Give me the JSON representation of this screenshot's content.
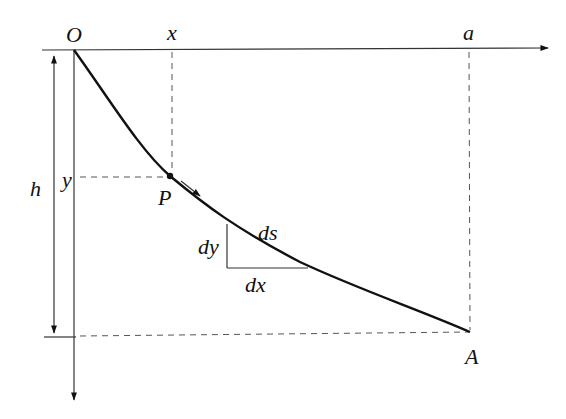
{
  "diagram": {
    "type": "brachistochrone-curve",
    "labels": {
      "origin": "O",
      "x": "x",
      "a": "a",
      "h": "h",
      "y": "y",
      "point": "P",
      "end": "A",
      "dy": "dy",
      "ds": "ds",
      "dx": "dx"
    },
    "colors": {
      "line": "#111111",
      "axis": "#333333",
      "dashed": "#555555",
      "background": "#ffffff"
    }
  }
}
